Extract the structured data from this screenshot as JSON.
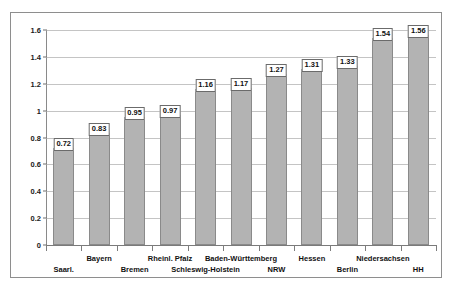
{
  "page": {
    "top_remnant_text": "",
    "background_color": "#ffffff"
  },
  "figure": {
    "frame_color": "#8e8e8e",
    "bar_fill_color": "#b3b3b3",
    "bar_edge_color": "#8a8a8a",
    "gridline_color": "#c4c4c4",
    "axis_color": "#8a8a8a",
    "label_box_background": "#ffffff",
    "label_box_border": "#6b6b6b"
  },
  "chart_data": {
    "type": "bar",
    "title": "",
    "xlabel": "",
    "ylabel": "",
    "ylim": [
      0,
      1.6
    ],
    "yticks": [
      0,
      0.2,
      0.4,
      0.6,
      0.8,
      1,
      1.2,
      1.4,
      1.6
    ],
    "ytick_labels": [
      "0",
      "0.2",
      "0.4",
      "0.6",
      "0.8",
      "1",
      "1.2",
      "1.4",
      "1.6"
    ],
    "grid": true,
    "legend": false,
    "label_stagger": true,
    "categories": [
      "Saarl.",
      "Bayern",
      "Bremen",
      "Rheinl. Pfalz",
      "Schleswig-Holstein",
      "Baden-Württemberg",
      "NRW",
      "Hessen",
      "Berlin",
      "Niedersachsen",
      "HH"
    ],
    "values": [
      0.72,
      0.83,
      0.95,
      0.97,
      1.16,
      1.17,
      1.27,
      1.31,
      1.33,
      1.54,
      1.56
    ],
    "value_labels": [
      "0.72",
      "0.83",
      "0.95",
      "0.97",
      "1.16",
      "1.17",
      "1.27",
      "1.31",
      "1.33",
      "1.54",
      "1.56"
    ]
  }
}
